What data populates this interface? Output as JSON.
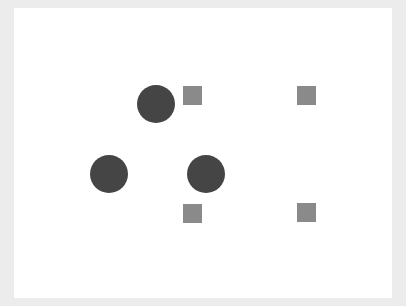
{
  "canvas": {
    "background": "#ffffff",
    "frame_color": "#ececec"
  },
  "shapes": {
    "circles": [
      {
        "id": "circle-1",
        "cx": 156,
        "cy": 104,
        "r": 19,
        "color": "#454545"
      },
      {
        "id": "circle-2",
        "cx": 109,
        "cy": 174,
        "r": 19,
        "color": "#454545"
      },
      {
        "id": "circle-3",
        "cx": 206,
        "cy": 174,
        "r": 19,
        "color": "#454545"
      }
    ],
    "squares": [
      {
        "id": "square-1",
        "x": 183,
        "y": 86,
        "size": 19,
        "color": "#8a8a8a"
      },
      {
        "id": "square-2",
        "x": 297,
        "y": 86,
        "size": 19,
        "color": "#8a8a8a"
      },
      {
        "id": "square-3",
        "x": 183,
        "y": 204,
        "size": 19,
        "color": "#8a8a8a"
      },
      {
        "id": "square-4",
        "x": 297,
        "y": 203,
        "size": 19,
        "color": "#8a8a8a"
      }
    ]
  }
}
